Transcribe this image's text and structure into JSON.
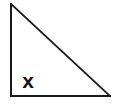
{
  "figure": {
    "type": "right-triangle",
    "background_color": "#ffffff",
    "stroke_color": "#1a1a1a",
    "stroke_width": 2,
    "vertices": {
      "apex_top_left": {
        "x": 11,
        "y": 4
      },
      "right_angle_bottom_left": {
        "x": 11,
        "y": 96
      },
      "bottom_right": {
        "x": 110,
        "y": 96
      }
    },
    "edges": [
      {
        "name": "vertical-leg",
        "from": "apex_top_left",
        "to": "right_angle_bottom_left"
      },
      {
        "name": "horizontal-leg",
        "from": "right_angle_bottom_left",
        "to": "bottom_right"
      },
      {
        "name": "hypotenuse",
        "from": "apex_top_left",
        "to": "bottom_right"
      }
    ],
    "labels": [
      {
        "name": "angle-label-x",
        "text": "x",
        "style": "bold",
        "position": {
          "x": 28,
          "y": 81
        },
        "color": "#111111"
      }
    ]
  }
}
